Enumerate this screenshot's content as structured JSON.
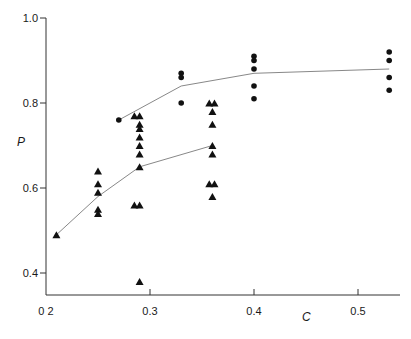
{
  "chart_data": {
    "type": "scatter",
    "title": "",
    "xlabel": "C",
    "ylabel": "P",
    "xlim": [
      0.2,
      0.54
    ],
    "ylim": [
      0.35,
      1.0
    ],
    "x_ticks": [
      0.2,
      0.3,
      0.4,
      0.5
    ],
    "x_tick_labels": [
      "0 2",
      "0.3",
      "0.4",
      "0.5"
    ],
    "y_ticks": [
      0.4,
      0.6,
      0.8,
      1.0
    ],
    "y_tick_labels": [
      "0.4",
      "0.6",
      "0.8",
      "1.0"
    ],
    "grid": false,
    "legend": null,
    "series": [
      {
        "name": "triangles",
        "marker": "triangle",
        "points": [
          [
            0.21,
            0.49
          ],
          [
            0.25,
            0.64
          ],
          [
            0.25,
            0.61
          ],
          [
            0.25,
            0.59
          ],
          [
            0.25,
            0.55
          ],
          [
            0.25,
            0.54
          ],
          [
            0.285,
            0.77
          ],
          [
            0.29,
            0.77
          ],
          [
            0.29,
            0.75
          ],
          [
            0.29,
            0.74
          ],
          [
            0.29,
            0.72
          ],
          [
            0.29,
            0.7
          ],
          [
            0.29,
            0.68
          ],
          [
            0.29,
            0.65
          ],
          [
            0.285,
            0.56
          ],
          [
            0.29,
            0.56
          ],
          [
            0.29,
            0.38
          ],
          [
            0.357,
            0.8
          ],
          [
            0.362,
            0.8
          ],
          [
            0.36,
            0.78
          ],
          [
            0.36,
            0.75
          ],
          [
            0.36,
            0.7
          ],
          [
            0.36,
            0.68
          ],
          [
            0.357,
            0.61
          ],
          [
            0.362,
            0.61
          ],
          [
            0.36,
            0.58
          ]
        ],
        "fit_line": [
          [
            0.21,
            0.49
          ],
          [
            0.25,
            0.58
          ],
          [
            0.29,
            0.65
          ],
          [
            0.36,
            0.7
          ]
        ]
      },
      {
        "name": "dots",
        "marker": "circle",
        "points": [
          [
            0.27,
            0.76
          ],
          [
            0.33,
            0.87
          ],
          [
            0.33,
            0.86
          ],
          [
            0.33,
            0.8
          ],
          [
            0.4,
            0.91
          ],
          [
            0.4,
            0.9
          ],
          [
            0.4,
            0.88
          ],
          [
            0.4,
            0.84
          ],
          [
            0.4,
            0.81
          ],
          [
            0.53,
            0.92
          ],
          [
            0.53,
            0.9
          ],
          [
            0.53,
            0.86
          ],
          [
            0.53,
            0.83
          ]
        ],
        "fit_line": [
          [
            0.27,
            0.76
          ],
          [
            0.33,
            0.84
          ],
          [
            0.4,
            0.87
          ],
          [
            0.53,
            0.88
          ]
        ]
      }
    ],
    "colors": {
      "axis": "#333333",
      "marker": "#111111",
      "line": "#888888"
    }
  }
}
